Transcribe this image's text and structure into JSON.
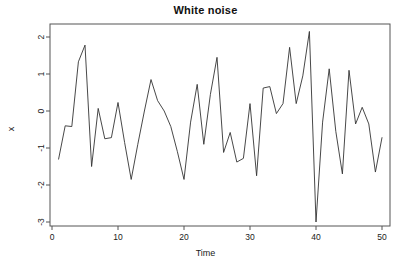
{
  "chart_data": {
    "type": "line",
    "title": "White noise",
    "xlabel": "Time",
    "ylabel": "x",
    "grid": false,
    "legend": null,
    "xlim": [
      1,
      50
    ],
    "ylim": [
      -3.0,
      2.15
    ],
    "xticks": [
      0,
      10,
      20,
      30,
      40,
      50
    ],
    "yticks": [
      2,
      1,
      0,
      -1,
      -2,
      -3
    ],
    "xtick_labels": [
      "0",
      "10",
      "20",
      "30",
      "40",
      "50"
    ],
    "ytick_labels": [
      "2",
      "1",
      "0",
      "-1",
      "-2",
      "-3"
    ],
    "line_color": "#333333",
    "box_color": "#555555",
    "series": [
      {
        "name": "x",
        "x": [
          1,
          2,
          3,
          4,
          5,
          6,
          7,
          8,
          9,
          10,
          11,
          12,
          13,
          14,
          15,
          16,
          17,
          18,
          19,
          20,
          21,
          22,
          23,
          24,
          25,
          26,
          27,
          28,
          29,
          30,
          31,
          32,
          33,
          34,
          35,
          36,
          37,
          38,
          39,
          40,
          41,
          42,
          43,
          44,
          45,
          46,
          47,
          48,
          49,
          50
        ],
        "values": [
          -1.3,
          -0.4,
          -0.42,
          1.33,
          1.78,
          -1.5,
          0.07,
          -0.75,
          -0.72,
          0.23,
          -0.85,
          -1.85,
          -0.9,
          0.0,
          0.85,
          0.28,
          0.0,
          -0.42,
          -1.1,
          -1.85,
          -0.3,
          0.72,
          -0.9,
          0.45,
          1.45,
          -1.12,
          -0.58,
          -1.38,
          -1.28,
          0.2,
          -1.75,
          0.62,
          0.66,
          -0.07,
          0.2,
          1.72,
          0.2,
          0.95,
          2.15,
          -3.0,
          -0.3,
          1.14,
          -0.55,
          -1.7,
          1.1,
          -0.35,
          0.1,
          -0.35,
          -1.65,
          -0.72
        ]
      }
    ]
  }
}
